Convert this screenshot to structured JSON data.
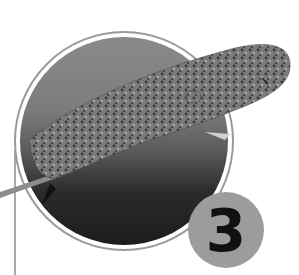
{
  "figure": {
    "color_mode": "grayscale",
    "frame": {
      "shape": "circle",
      "ring_color": "#9a9a9a"
    },
    "badge": {
      "number": "3",
      "background": "#9c9c9c",
      "text_color": "#111111"
    },
    "accent_line_color": "#a8a8a8"
  }
}
